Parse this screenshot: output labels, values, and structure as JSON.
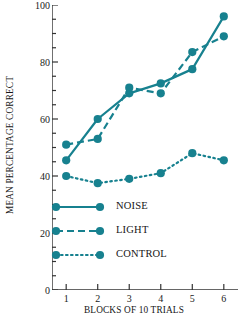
{
  "chart_data": {
    "type": "line",
    "title": "",
    "xlabel": "BLOCKS OF 10 TRIALS",
    "ylabel": "MEAN PERCENTAGE CORRECT",
    "x": [
      1,
      2,
      3,
      4,
      5,
      6
    ],
    "categories": [
      "1",
      "2",
      "3",
      "4",
      "5",
      "6"
    ],
    "xlim": [
      0.55,
      6.45
    ],
    "ylim": [
      0,
      100
    ],
    "y_ticks": [
      0,
      20,
      40,
      60,
      80,
      100
    ],
    "y_tick_labels": [
      "0",
      "20",
      "40",
      "60",
      "80",
      "100"
    ],
    "y_minor_tick_step": 5,
    "x_ticks": [
      1,
      2,
      3,
      4,
      5,
      6
    ],
    "grid": false,
    "legend_position": "inside-lower-left",
    "series_color": "#17818f",
    "series": [
      {
        "name": "NOISE",
        "style": "solid",
        "values": [
          45.5,
          60,
          69,
          72.5,
          77.5,
          96
        ]
      },
      {
        "name": "LIGHT",
        "style": "dashed",
        "values": [
          51,
          53,
          71,
          69,
          83.5,
          89
        ]
      },
      {
        "name": "CONTROL",
        "style": "dotted",
        "values": [
          40,
          37.5,
          39,
          41,
          48,
          45.5
        ]
      }
    ]
  },
  "legend": {
    "items": [
      {
        "label": "NOISE",
        "style": "solid"
      },
      {
        "label": "LIGHT",
        "style": "dashed"
      },
      {
        "label": "CONTROL",
        "style": "dotted"
      }
    ]
  },
  "axes": {
    "y_title": "MEAN PERCENTAGE CORRECT",
    "x_title": "BLOCKS OF 10 TRIALS"
  }
}
